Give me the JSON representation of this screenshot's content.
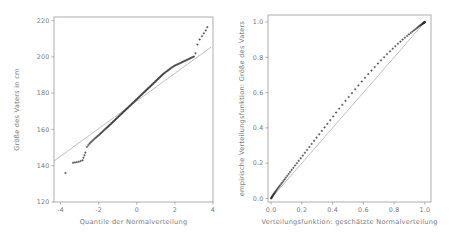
{
  "figure": {
    "background_color": "#ffffff",
    "axis_color": "#9a9a9a",
    "refline_color": "#b9b9b9",
    "marker_color": "#2b2b2b",
    "text_color": "#7a7a7a"
  },
  "chart_data": [
    {
      "id": "qq-plot",
      "type": "scatter",
      "title": "",
      "xlabel": "Quantile der Normalverteilung",
      "ylabel": "Größe des Vaters in cm",
      "xlim": [
        -4.35,
        4.0
      ],
      "ylim": [
        120,
        222
      ],
      "xticks": [
        -4,
        -2,
        0,
        2,
        4
      ],
      "xticklabels": [
        "-4",
        "-2",
        "0",
        "2",
        "4"
      ],
      "yticks": [
        120,
        140,
        160,
        180,
        200,
        220
      ],
      "yticklabels": [
        "120",
        "140",
        "160",
        "180",
        "200",
        "220"
      ],
      "grid": false,
      "legend": "none",
      "marker": "plus",
      "reference_line": {
        "description": "Gerade durch die Quartile der Normalverteilung",
        "x": [
          -4.35,
          3.9
        ],
        "y": [
          142.6,
          205.4
        ],
        "color": "#b9b9b9"
      },
      "x": [
        -3.75,
        -3.35,
        -3.25,
        -3.15,
        -3.05,
        -2.95,
        -2.85,
        -2.8,
        -2.75,
        -2.7,
        -2.62,
        -2.55,
        -2.48,
        -2.42,
        -2.36,
        -2.3,
        -2.24,
        -2.18,
        -2.12,
        -2.06,
        -2.0,
        -1.95,
        -1.9,
        -1.85,
        -1.8,
        -1.75,
        -1.7,
        -1.65,
        -1.6,
        -1.56,
        -1.52,
        -1.48,
        -1.44,
        -1.4,
        -1.36,
        -1.32,
        -1.28,
        -1.24,
        -1.2,
        -1.16,
        -1.12,
        -1.08,
        -1.04,
        -1.0,
        -0.96,
        -0.92,
        -0.88,
        -0.84,
        -0.8,
        -0.76,
        -0.72,
        -0.68,
        -0.64,
        -0.6,
        -0.56,
        -0.52,
        -0.48,
        -0.44,
        -0.4,
        -0.36,
        -0.32,
        -0.28,
        -0.24,
        -0.2,
        -0.16,
        -0.12,
        -0.08,
        -0.04,
        0.0,
        0.04,
        0.08,
        0.12,
        0.16,
        0.2,
        0.24,
        0.28,
        0.32,
        0.36,
        0.4,
        0.44,
        0.48,
        0.52,
        0.56,
        0.6,
        0.64,
        0.68,
        0.72,
        0.76,
        0.8,
        0.84,
        0.88,
        0.92,
        0.96,
        1.0,
        1.04,
        1.08,
        1.12,
        1.16,
        1.2,
        1.24,
        1.28,
        1.32,
        1.36,
        1.4,
        1.45,
        1.5,
        1.55,
        1.6,
        1.65,
        1.7,
        1.75,
        1.8,
        1.86,
        1.92,
        1.98,
        2.04,
        2.1,
        2.16,
        2.22,
        2.28,
        2.34,
        2.4,
        2.46,
        2.52,
        2.58,
        2.64,
        2.7,
        2.76,
        2.82,
        2.88,
        2.94,
        3.0,
        3.08,
        3.18,
        3.3,
        3.42,
        3.52,
        3.62,
        3.7
      ],
      "y": [
        136.0,
        141.6,
        141.8,
        142.0,
        142.2,
        142.6,
        143.0,
        144.4,
        145.8,
        147.2,
        150.4,
        151.4,
        152.2,
        152.9,
        153.5,
        154.1,
        154.7,
        155.3,
        155.8,
        156.3,
        156.8,
        157.3,
        157.8,
        158.3,
        158.8,
        159.3,
        159.8,
        160.3,
        160.7,
        161.1,
        161.5,
        161.9,
        162.3,
        162.7,
        163.1,
        163.5,
        163.9,
        164.3,
        164.7,
        165.1,
        165.5,
        165.9,
        166.3,
        166.7,
        167.1,
        167.5,
        167.9,
        168.3,
        168.7,
        169.1,
        169.5,
        169.9,
        170.3,
        170.7,
        171.1,
        171.5,
        171.9,
        172.3,
        172.7,
        173.1,
        173.5,
        173.9,
        174.3,
        174.7,
        175.1,
        175.5,
        175.9,
        176.3,
        176.7,
        177.1,
        177.5,
        177.9,
        178.3,
        178.7,
        179.1,
        179.5,
        179.9,
        180.3,
        180.7,
        181.1,
        181.5,
        181.9,
        182.3,
        182.7,
        183.1,
        183.5,
        183.9,
        184.3,
        184.7,
        185.1,
        185.5,
        185.9,
        186.3,
        186.7,
        187.1,
        187.5,
        187.9,
        188.3,
        188.7,
        189.1,
        189.5,
        189.9,
        190.3,
        190.7,
        191.1,
        191.5,
        191.9,
        192.3,
        192.7,
        193.1,
        193.5,
        193.9,
        194.3,
        194.7,
        195.1,
        195.4,
        195.7,
        196.0,
        196.3,
        196.6,
        196.9,
        197.2,
        197.5,
        197.8,
        198.1,
        198.4,
        198.7,
        199.0,
        199.3,
        199.6,
        199.9,
        200.2,
        202.0,
        206.8,
        209.6,
        211.4,
        213.0,
        214.6,
        216.4
      ]
    },
    {
      "id": "pp-plot",
      "type": "scatter",
      "title": "",
      "xlabel": "Verteilungsfunktion: geschätzte Normalverteilung",
      "ylabel": "empirische Verteilungsfunktion: Größe des Vaters",
      "xlim": [
        -0.02,
        1.04
      ],
      "ylim": [
        -0.02,
        1.04
      ],
      "xticks": [
        0.0,
        0.2,
        0.4,
        0.6,
        0.8,
        1.0
      ],
      "xticklabels": [
        "0.0",
        "0.2",
        "0.4",
        "0.6",
        "0.8",
        "1.0"
      ],
      "yticks": [
        0.0,
        0.2,
        0.4,
        0.6,
        0.8,
        1.0
      ],
      "yticklabels": [
        "0.0",
        "0.2",
        "0.4",
        "0.6",
        "0.8",
        "1.0"
      ],
      "grid": false,
      "legend": "none",
      "marker": "plus",
      "reference_line": {
        "description": "Winkelhalbierende y = x",
        "x": [
          0.0,
          1.0
        ],
        "y": [
          0.0,
          1.0
        ],
        "color": "#b9b9b9"
      },
      "x": [
        0.0,
        0.002,
        0.004,
        0.006,
        0.008,
        0.01,
        0.013,
        0.016,
        0.019,
        0.022,
        0.026,
        0.03,
        0.035,
        0.04,
        0.046,
        0.052,
        0.058,
        0.065,
        0.072,
        0.08,
        0.088,
        0.096,
        0.105,
        0.114,
        0.124,
        0.134,
        0.145,
        0.156,
        0.168,
        0.18,
        0.193,
        0.206,
        0.22,
        0.234,
        0.249,
        0.264,
        0.28,
        0.296,
        0.313,
        0.33,
        0.348,
        0.366,
        0.385,
        0.404,
        0.423,
        0.443,
        0.463,
        0.484,
        0.505,
        0.526,
        0.547,
        0.568,
        0.59,
        0.611,
        0.632,
        0.653,
        0.674,
        0.695,
        0.715,
        0.735,
        0.754,
        0.773,
        0.791,
        0.808,
        0.825,
        0.841,
        0.856,
        0.87,
        0.884,
        0.896,
        0.908,
        0.919,
        0.929,
        0.938,
        0.947,
        0.954,
        0.961,
        0.967,
        0.972,
        0.977,
        0.981,
        0.985,
        0.988,
        0.99,
        0.992,
        0.994,
        0.996,
        0.997,
        0.998,
        0.999,
        1.0
      ],
      "y": [
        0.0,
        0.003,
        0.006,
        0.009,
        0.012,
        0.015,
        0.019,
        0.023,
        0.027,
        0.031,
        0.036,
        0.041,
        0.047,
        0.053,
        0.06,
        0.067,
        0.074,
        0.082,
        0.09,
        0.099,
        0.108,
        0.118,
        0.128,
        0.139,
        0.15,
        0.162,
        0.174,
        0.187,
        0.2,
        0.214,
        0.228,
        0.243,
        0.259,
        0.275,
        0.292,
        0.309,
        0.327,
        0.345,
        0.364,
        0.383,
        0.403,
        0.423,
        0.444,
        0.465,
        0.487,
        0.509,
        0.531,
        0.553,
        0.575,
        0.597,
        0.619,
        0.641,
        0.663,
        0.684,
        0.705,
        0.725,
        0.745,
        0.765,
        0.783,
        0.801,
        0.818,
        0.834,
        0.849,
        0.863,
        0.877,
        0.889,
        0.901,
        0.911,
        0.921,
        0.93,
        0.938,
        0.946,
        0.953,
        0.959,
        0.965,
        0.97,
        0.975,
        0.979,
        0.982,
        0.985,
        0.988,
        0.99,
        0.992,
        0.994,
        0.995,
        0.996,
        0.997,
        0.998,
        0.999,
        0.999,
        1.0
      ]
    }
  ]
}
